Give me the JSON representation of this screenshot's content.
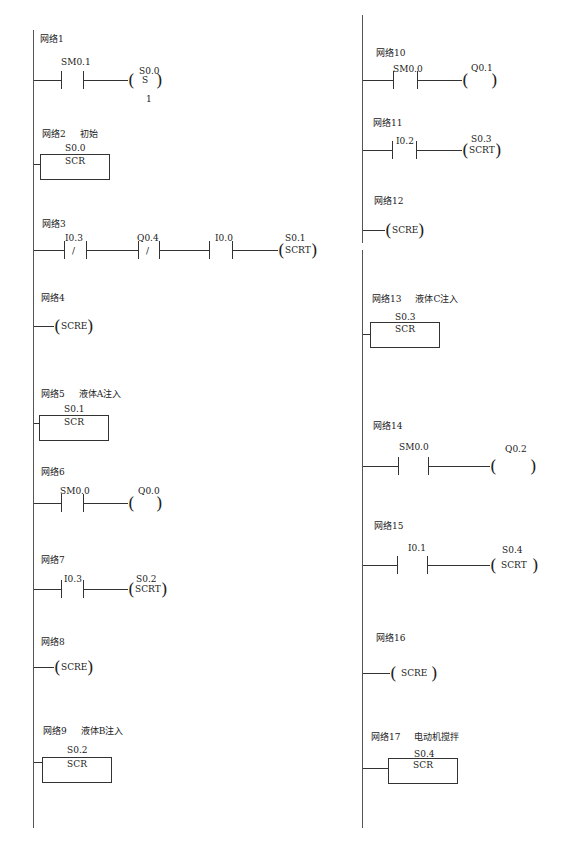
{
  "diagram_type": "PLC ladder diagram (SCR sequential control)",
  "columns": [
    {
      "networks": [
        {
          "id": "net1",
          "label": "网络1",
          "comment": "",
          "contacts": [
            {
              "addr": "SM0.1",
              "type": "NO"
            }
          ],
          "output": {
            "addr": "S0.0",
            "type": "coil",
            "text": "S",
            "param": "1"
          }
        },
        {
          "id": "net2",
          "label": "网络2",
          "comment": "初始",
          "box": {
            "addr": "S0.0",
            "text": "SCR"
          }
        },
        {
          "id": "net3",
          "label": "网络3",
          "comment": "",
          "contacts": [
            {
              "addr": "I0.3",
              "type": "NC",
              "mark": "/"
            },
            {
              "addr": "Q0.4",
              "type": "NC",
              "mark": "/"
            },
            {
              "addr": "I0.0",
              "type": "NO"
            }
          ],
          "output": {
            "addr": "S0.1",
            "type": "coil",
            "text": "SCRT"
          }
        },
        {
          "id": "net4",
          "label": "网络4",
          "comment": "",
          "output": {
            "addr": "",
            "type": "coil",
            "text": "SCRE"
          }
        },
        {
          "id": "net5",
          "label": "网络5",
          "comment": "液体A注入",
          "box": {
            "addr": "S0.1",
            "text": "SCR"
          }
        },
        {
          "id": "net6",
          "label": "网络6",
          "comment": "",
          "contacts": [
            {
              "addr": "SM0.0",
              "type": "NO"
            }
          ],
          "output": {
            "addr": "Q0.0",
            "type": "coil",
            "text": ""
          }
        },
        {
          "id": "net7",
          "label": "网络7",
          "comment": "",
          "contacts": [
            {
              "addr": "I0.3",
              "type": "NO"
            }
          ],
          "output": {
            "addr": "S0.2",
            "type": "coil",
            "text": "SCRT"
          }
        },
        {
          "id": "net8",
          "label": "网络8",
          "comment": "",
          "output": {
            "addr": "",
            "type": "coil",
            "text": "SCRE"
          }
        },
        {
          "id": "net9",
          "label": "网络9",
          "comment": "液体B注入",
          "box": {
            "addr": "S0.2",
            "text": "SCR"
          }
        }
      ]
    },
    {
      "networks": [
        {
          "id": "net10",
          "label": "网络10",
          "comment": "",
          "contacts": [
            {
              "addr": "SM0.0",
              "type": "NO"
            }
          ],
          "output": {
            "addr": "Q0.1",
            "type": "coil",
            "text": ""
          }
        },
        {
          "id": "net11",
          "label": "网络11",
          "comment": "",
          "contacts": [
            {
              "addr": "I0.2",
              "type": "NO"
            }
          ],
          "output": {
            "addr": "S0.3",
            "type": "coil",
            "text": "SCRT"
          }
        },
        {
          "id": "net12",
          "label": "网络12",
          "comment": "",
          "output": {
            "addr": "",
            "type": "coil",
            "text": "SCRE"
          }
        },
        {
          "id": "net13",
          "label": "网络13",
          "comment": "液体C注入",
          "box": {
            "addr": "S0.3",
            "text": "SCR"
          }
        },
        {
          "id": "net14",
          "label": "网络14",
          "comment": "",
          "contacts": [
            {
              "addr": "SM0.0",
              "type": "NO"
            }
          ],
          "output": {
            "addr": "Q0.2",
            "type": "coil",
            "text": ""
          }
        },
        {
          "id": "net15",
          "label": "网络15",
          "comment": "",
          "contacts": [
            {
              "addr": "I0.1",
              "type": "NO"
            }
          ],
          "output": {
            "addr": "S0.4",
            "type": "coil",
            "text": "SCRT"
          }
        },
        {
          "id": "net16",
          "label": "网络16",
          "comment": "",
          "output": {
            "addr": "",
            "type": "coil",
            "text": "SCRE"
          }
        },
        {
          "id": "net17",
          "label": "网络17",
          "comment": "电动机搅拌",
          "box": {
            "addr": "S0.4",
            "text": "SCR"
          }
        }
      ]
    }
  ]
}
